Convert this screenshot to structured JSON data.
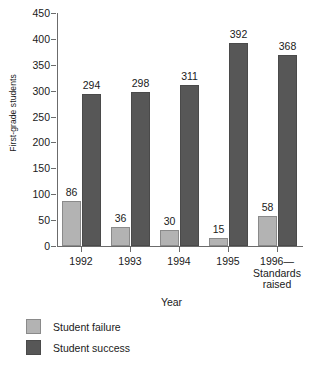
{
  "chart_data": {
    "type": "bar",
    "title": "",
    "xlabel": "Year",
    "ylabel": "First-grade students",
    "categories": [
      "1992",
      "1993",
      "1994",
      "1995",
      "1996—\nStandards\nraised"
    ],
    "series": [
      {
        "name": "Student failure",
        "color": "#b3b3b3",
        "values": [
          86,
          36,
          30,
          15,
          58
        ]
      },
      {
        "name": "Student success",
        "color": "#575757",
        "values": [
          294,
          298,
          311,
          392,
          368
        ]
      }
    ],
    "ylim": [
      0,
      450
    ],
    "ytick_step": 50,
    "yticks": [
      0,
      50,
      100,
      150,
      200,
      250,
      300,
      350,
      400,
      450
    ],
    "grid": false,
    "legend_position": "bottom-left",
    "data_labels": true
  },
  "axis": {
    "ylabel": "First-grade students",
    "xlabel": "Year"
  },
  "legend": {
    "items": [
      {
        "label": "Student failure"
      },
      {
        "label": "Student success"
      }
    ]
  }
}
